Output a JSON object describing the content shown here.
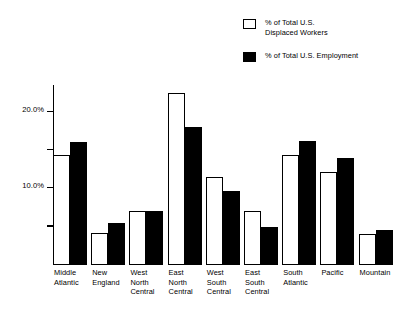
{
  "chart_data": {
    "type": "bar",
    "title": "",
    "subtitle": "",
    "xlabel": "",
    "ylabel": "",
    "ylim": [
      0,
      23.5
    ],
    "grid": false,
    "legend_position": "top-right",
    "y_ticks": [
      {
        "value": 20,
        "label": "20.0%",
        "labeled": true
      },
      {
        "value": 15,
        "label": "",
        "labeled": false
      },
      {
        "value": 10,
        "label": "10.0%",
        "labeled": true
      },
      {
        "value": 5,
        "label": "",
        "labeled": false
      }
    ],
    "categories": [
      "Middle\nAtlantic",
      "New\nEngland",
      "West\nNorth\nCentral",
      "East\nNorth\nCentral",
      "West\nSouth\nCentral",
      "East\nSouth\nCentral",
      "South\nAtlantic",
      "Pacific",
      "Mountain"
    ],
    "series": [
      {
        "name": "% of Total U.S.\nDisplaced Workers",
        "style": "open",
        "color": "#ffffff",
        "edge_color": "#000000",
        "values": [
          14.4,
          4.2,
          7.1,
          22.4,
          11.5,
          7.1,
          14.3,
          12.1,
          4.1
        ]
      },
      {
        "name": "% of Total U.S. Employment",
        "style": "filled",
        "color": "#000000",
        "edge_color": "#000000",
        "values": [
          16.1,
          5.5,
          7.1,
          18.0,
          9.7,
          5.0,
          16.2,
          14.0,
          4.6
        ]
      }
    ]
  },
  "legend": {
    "items": [
      {
        "label": "% of Total U.S.\nDisplaced Workers",
        "swatch": "open-square-swatch"
      },
      {
        "label": "%  of Total U.S. Employment",
        "swatch": "filled-square-swatch"
      }
    ]
  }
}
